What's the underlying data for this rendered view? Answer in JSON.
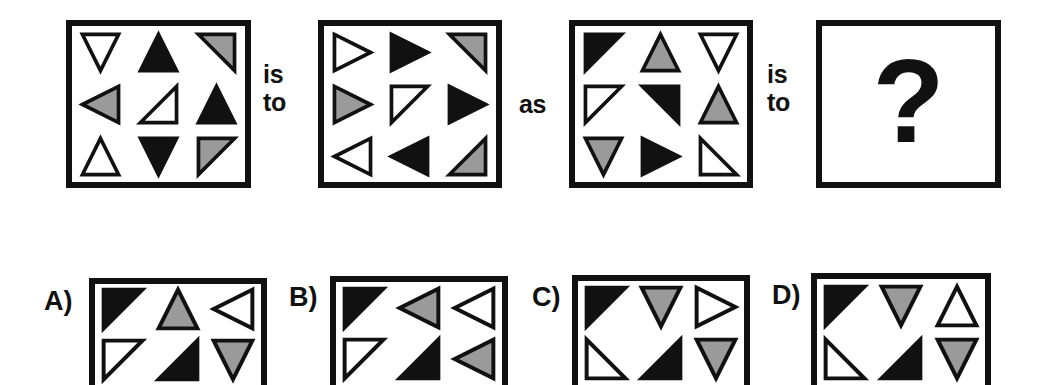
{
  "puzzle": {
    "type": "visual-analogy-matrix",
    "connector_1": {
      "line1": "is",
      "line2": "to"
    },
    "connector_2": {
      "text": "as"
    },
    "connector_3": {
      "line1": "is",
      "line2": "to"
    },
    "answer_placeholder": "?",
    "colors": {
      "outline": "#111111",
      "fill_black": "#111111",
      "fill_gray": "#9a9a9a",
      "fill_white": "#ffffff",
      "background": "#ffffff"
    },
    "stimulus_panels": [
      {
        "name": "panel-a",
        "rows": 3,
        "cols": 3,
        "cells": [
          {
            "shape": "triangle-down",
            "fill": "white",
            "name": "triangle-down-white"
          },
          {
            "shape": "triangle-up",
            "fill": "black",
            "name": "triangle-up-black"
          },
          {
            "shape": "right-triangle-ne",
            "fill": "gray",
            "name": "right-triangle-ne-gray"
          },
          {
            "shape": "triangle-left",
            "fill": "gray",
            "name": "triangle-left-gray"
          },
          {
            "shape": "right-triangle-se",
            "fill": "white",
            "name": "right-triangle-se-white"
          },
          {
            "shape": "triangle-up",
            "fill": "black",
            "name": "triangle-up-black"
          },
          {
            "shape": "triangle-up",
            "fill": "white",
            "name": "triangle-up-white"
          },
          {
            "shape": "triangle-down",
            "fill": "black",
            "name": "triangle-down-black"
          },
          {
            "shape": "right-triangle-nw",
            "fill": "gray",
            "name": "right-triangle-nw-gray"
          }
        ]
      },
      {
        "name": "panel-b",
        "rows": 3,
        "cols": 3,
        "cells": [
          {
            "shape": "triangle-right",
            "fill": "white",
            "name": "triangle-right-white"
          },
          {
            "shape": "triangle-right",
            "fill": "black",
            "name": "triangle-right-black"
          },
          {
            "shape": "right-triangle-ne",
            "fill": "gray",
            "name": "right-triangle-ne-gray"
          },
          {
            "shape": "triangle-right",
            "fill": "gray",
            "name": "triangle-right-gray"
          },
          {
            "shape": "right-triangle-nw",
            "fill": "white",
            "name": "right-triangle-nw-white"
          },
          {
            "shape": "triangle-right",
            "fill": "black",
            "name": "triangle-right-black"
          },
          {
            "shape": "triangle-left",
            "fill": "white",
            "name": "triangle-left-white"
          },
          {
            "shape": "triangle-left",
            "fill": "black",
            "name": "triangle-left-black"
          },
          {
            "shape": "right-triangle-se",
            "fill": "gray",
            "name": "right-triangle-se-gray"
          }
        ]
      },
      {
        "name": "panel-c",
        "rows": 3,
        "cols": 3,
        "cells": [
          {
            "shape": "right-triangle-nw",
            "fill": "black",
            "name": "right-triangle-nw-black"
          },
          {
            "shape": "triangle-up",
            "fill": "gray",
            "name": "triangle-up-gray"
          },
          {
            "shape": "triangle-down",
            "fill": "white",
            "name": "triangle-down-white"
          },
          {
            "shape": "right-triangle-nw",
            "fill": "white",
            "name": "right-triangle-nw-white"
          },
          {
            "shape": "right-triangle-ne",
            "fill": "black",
            "name": "right-triangle-ne-black"
          },
          {
            "shape": "triangle-up",
            "fill": "gray",
            "name": "triangle-up-gray"
          },
          {
            "shape": "triangle-down",
            "fill": "gray",
            "name": "triangle-down-gray"
          },
          {
            "shape": "triangle-right",
            "fill": "black",
            "name": "triangle-right-black"
          },
          {
            "shape": "right-triangle-sw",
            "fill": "white",
            "name": "right-triangle-sw-white"
          }
        ]
      }
    ],
    "options": [
      {
        "label": "A)",
        "name": "option-a",
        "rows": 2,
        "cols": 3,
        "cells": [
          {
            "shape": "right-triangle-nw",
            "fill": "black",
            "name": "right-triangle-nw-black"
          },
          {
            "shape": "triangle-up",
            "fill": "gray",
            "name": "triangle-up-gray"
          },
          {
            "shape": "triangle-left",
            "fill": "white",
            "name": "triangle-left-white"
          },
          {
            "shape": "right-triangle-nw",
            "fill": "white",
            "name": "right-triangle-nw-white"
          },
          {
            "shape": "right-triangle-se",
            "fill": "black",
            "name": "right-triangle-se-black"
          },
          {
            "shape": "triangle-down",
            "fill": "gray",
            "name": "triangle-down-gray"
          }
        ]
      },
      {
        "label": "B)",
        "name": "option-b",
        "rows": 2,
        "cols": 3,
        "cells": [
          {
            "shape": "right-triangle-nw",
            "fill": "black",
            "name": "right-triangle-nw-black"
          },
          {
            "shape": "triangle-left",
            "fill": "gray",
            "name": "triangle-left-gray"
          },
          {
            "shape": "triangle-left",
            "fill": "white",
            "name": "triangle-left-white"
          },
          {
            "shape": "right-triangle-nw",
            "fill": "white",
            "name": "right-triangle-nw-white"
          },
          {
            "shape": "right-triangle-se",
            "fill": "black",
            "name": "right-triangle-se-black"
          },
          {
            "shape": "triangle-left",
            "fill": "gray",
            "name": "triangle-left-gray"
          }
        ]
      },
      {
        "label": "C)",
        "name": "option-c",
        "rows": 2,
        "cols": 3,
        "cells": [
          {
            "shape": "right-triangle-nw",
            "fill": "black",
            "name": "right-triangle-nw-black"
          },
          {
            "shape": "triangle-down",
            "fill": "gray",
            "name": "triangle-down-gray"
          },
          {
            "shape": "triangle-right",
            "fill": "white",
            "name": "triangle-right-white"
          },
          {
            "shape": "right-triangle-sw",
            "fill": "white",
            "name": "right-triangle-sw-white"
          },
          {
            "shape": "right-triangle-se",
            "fill": "black",
            "name": "right-triangle-se-black"
          },
          {
            "shape": "triangle-down",
            "fill": "gray",
            "name": "triangle-down-gray"
          }
        ]
      },
      {
        "label": "D)",
        "name": "option-d",
        "rows": 2,
        "cols": 3,
        "cells": [
          {
            "shape": "right-triangle-nw",
            "fill": "black",
            "name": "right-triangle-nw-black"
          },
          {
            "shape": "triangle-down",
            "fill": "gray",
            "name": "triangle-down-gray"
          },
          {
            "shape": "triangle-up",
            "fill": "white",
            "name": "triangle-up-white"
          },
          {
            "shape": "right-triangle-sw",
            "fill": "white",
            "name": "right-triangle-sw-white"
          },
          {
            "shape": "right-triangle-se",
            "fill": "black",
            "name": "right-triangle-se-black"
          },
          {
            "shape": "triangle-down",
            "fill": "gray",
            "name": "triangle-down-gray"
          }
        ]
      }
    ]
  }
}
